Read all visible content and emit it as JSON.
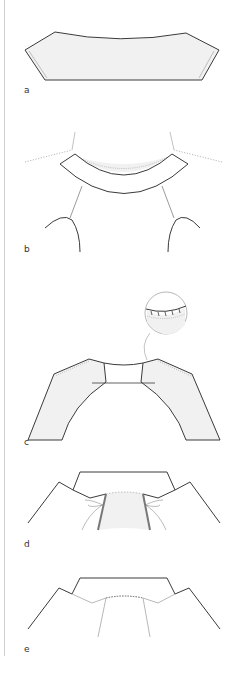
{
  "figures": [
    {
      "id": "a",
      "label": "a"
    },
    {
      "id": "b",
      "label": "b"
    },
    {
      "id": "c",
      "label": "c"
    },
    {
      "id": "d",
      "label": "d"
    },
    {
      "id": "e",
      "label": "e"
    }
  ],
  "colors": {
    "stroke": "#3a3a3a",
    "fill": "#f1f1f1",
    "dotted": "#9a9a9a",
    "rule": "#cfcfcf"
  }
}
